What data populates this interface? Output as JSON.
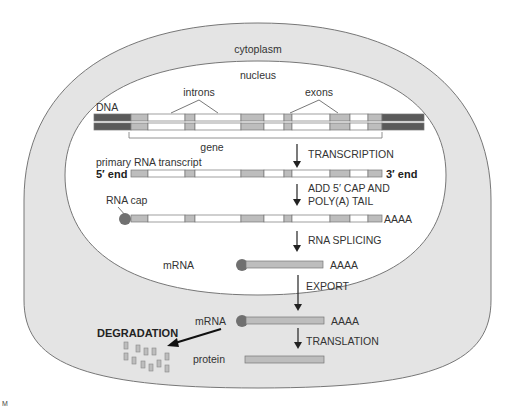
{
  "labels": {
    "cytoplasm": "cytoplasm",
    "nucleus": "nucleus",
    "introns": "introns",
    "exons": "exons",
    "dna": "DNA",
    "gene": "gene",
    "primary_transcript": "primary RNA transcript",
    "five_end": "5′ end",
    "three_end": "3′ end",
    "rna_cap": "RNA cap",
    "poly_a_1": "AAAA",
    "poly_a_2": "AAAA",
    "poly_a_3": "AAAA",
    "mrna_nucleus": "mRNA",
    "mrna_cytoplasm": "mRNA",
    "protein": "protein",
    "degradation": "DEGRADATION"
  },
  "steps": {
    "transcription": "TRANSCRIPTION",
    "cap_tail_line1": "ADD 5′ CAP AND",
    "cap_tail_line2": "POLY(A) TAIL",
    "splicing": "RNA SPLICING",
    "export": "EXPORT",
    "translation": "TRANSLATION"
  },
  "corner_mark": "M",
  "colors": {
    "cytoplasm_fill": "#e4e4e4",
    "nucleus_fill": "#ffffff",
    "outline": "#777777",
    "flank_dark": "#5a5a5a",
    "exon_gray": "#bdbdbd",
    "intron_white": "#ffffff",
    "cap": "#707070",
    "fragment": "#bdbdbd"
  }
}
